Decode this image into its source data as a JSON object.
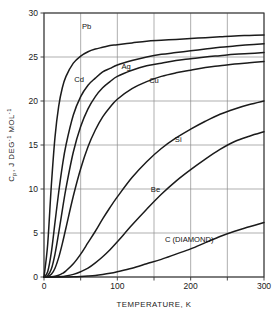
{
  "chart_data": {
    "type": "line",
    "title": "",
    "xlabel": "TEMPERATURE, K",
    "ylabel": "Cp, J DEG-1 MOL-1",
    "ylabel_parts": {
      "symbol": "C",
      "subscript": "p",
      "rest": ", J DEG",
      "exp1": "-1",
      "rest2": " MOL",
      "exp2": "-1"
    },
    "xlim": [
      0,
      300
    ],
    "ylim": [
      0,
      30
    ],
    "xticks": [
      0,
      50,
      100,
      150,
      200,
      250,
      300
    ],
    "xtick_labels": [
      "0",
      "",
      "100",
      "",
      "200",
      "",
      "300"
    ],
    "yticks": [
      0,
      5,
      10,
      15,
      20,
      25,
      30
    ],
    "ytick_labels": [
      "0",
      "5",
      "10",
      "15",
      "20",
      "25",
      "30"
    ],
    "grid": true,
    "legend_position": "inline-labels",
    "x": [
      0,
      5,
      10,
      15,
      20,
      25,
      30,
      40,
      50,
      60,
      70,
      80,
      90,
      100,
      120,
      140,
      160,
      180,
      200,
      220,
      240,
      260,
      280,
      300
    ],
    "series": [
      {
        "name": "Pb",
        "label": "Pb",
        "label_xy": [
          58,
          28.2
        ],
        "debye_temperature": 88,
        "values": [
          0.0,
          3.7,
          10.4,
          15.9,
          19.4,
          21.5,
          22.8,
          24.3,
          25.1,
          25.6,
          25.9,
          26.1,
          26.3,
          26.4,
          26.6,
          26.8,
          26.9,
          27.0,
          27.1,
          27.2,
          27.3,
          27.4,
          27.45,
          27.5
        ]
      },
      {
        "name": "Cd",
        "label": "Cd",
        "label_xy": [
          48,
          22.2
        ],
        "debye_temperature": 209,
        "values": [
          0.0,
          0.6,
          2.8,
          6.2,
          9.6,
          12.6,
          15.0,
          18.4,
          20.5,
          21.8,
          22.6,
          23.3,
          23.7,
          24.1,
          24.6,
          25.0,
          25.3,
          25.5,
          25.7,
          25.9,
          26.1,
          26.25,
          26.4,
          26.5
        ]
      },
      {
        "name": "Ag",
        "label": "Ag",
        "label_xy": [
          112,
          23.6
        ],
        "debye_temperature": 215,
        "values": [
          0.0,
          0.15,
          0.9,
          2.6,
          5.0,
          7.6,
          10.1,
          14.2,
          17.1,
          19.1,
          20.5,
          21.5,
          22.2,
          22.8,
          23.5,
          24.0,
          24.3,
          24.6,
          24.8,
          25.0,
          25.15,
          25.3,
          25.4,
          25.5
        ]
      },
      {
        "name": "Cu",
        "label": "Cu",
        "label_xy": [
          150,
          22.0
        ],
        "debye_temperature": 315,
        "values": [
          0.0,
          0.05,
          0.3,
          1.0,
          2.2,
          3.8,
          5.6,
          9.2,
          12.3,
          14.8,
          16.7,
          18.2,
          19.3,
          20.2,
          21.4,
          22.2,
          22.8,
          23.2,
          23.5,
          23.8,
          24.0,
          24.2,
          24.35,
          24.5
        ]
      },
      {
        "name": "Si",
        "label": "Si",
        "label_xy": [
          183,
          15.3
        ],
        "debye_temperature": 645,
        "values": [
          0.0,
          0.0,
          0.02,
          0.08,
          0.2,
          0.4,
          0.7,
          1.5,
          2.6,
          3.9,
          5.2,
          6.6,
          7.9,
          9.1,
          11.3,
          13.1,
          14.6,
          15.8,
          16.8,
          17.7,
          18.5,
          19.1,
          19.6,
          20.0
        ]
      },
      {
        "name": "Be",
        "label": "Be",
        "label_xy": [
          152,
          9.7
        ],
        "debye_temperature": 1440,
        "values": [
          0.0,
          0.0,
          0.0,
          0.01,
          0.03,
          0.06,
          0.11,
          0.3,
          0.6,
          1.0,
          1.6,
          2.3,
          3.1,
          4.0,
          5.9,
          7.7,
          9.4,
          10.9,
          12.2,
          13.4,
          14.5,
          15.4,
          16.0,
          16.5
        ]
      },
      {
        "name": "C (DIAMOND)",
        "label": "C (DIAMOND)",
        "label_xy": [
          198,
          4.0
        ],
        "debye_temperature": 2230,
        "values": [
          0.0,
          0.0,
          0.0,
          0.0,
          0.0,
          0.0,
          0.01,
          0.02,
          0.05,
          0.1,
          0.17,
          0.28,
          0.42,
          0.6,
          1.0,
          1.5,
          2.0,
          2.6,
          3.2,
          3.9,
          4.6,
          5.2,
          5.7,
          6.2
        ]
      }
    ]
  },
  "figure": {
    "background_color": "#ffffff",
    "line_color": "#1b1b1b",
    "grid_color": "#8d8d8d",
    "frame_color": "#333333"
  }
}
